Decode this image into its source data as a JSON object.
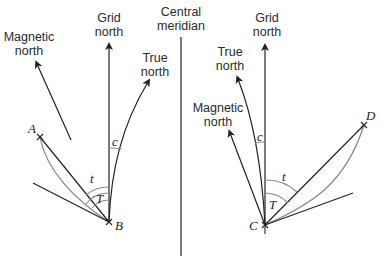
{
  "diagram": {
    "central_meridian": {
      "label_line1": "Central",
      "label_line2": "meridian"
    },
    "left": {
      "grid_north": {
        "line1": "Grid",
        "line2": "north"
      },
      "true_north": {
        "line1": "True",
        "line2": "north"
      },
      "magnetic_north": {
        "line1": "Magnetic",
        "line2": "north"
      },
      "point_a": "A",
      "point_b": "B",
      "angle_c": "c",
      "angle_t": "t",
      "angle_T": "T"
    },
    "right": {
      "grid_north": {
        "line1": "Grid",
        "line2": "north"
      },
      "true_north": {
        "line1": "True",
        "line2": "north"
      },
      "magnetic_north": {
        "line1": "Magnetic",
        "line2": "north"
      },
      "point_c": "C",
      "point_d": "D",
      "angle_c": "c",
      "angle_t": "t",
      "angle_T": "T"
    }
  }
}
